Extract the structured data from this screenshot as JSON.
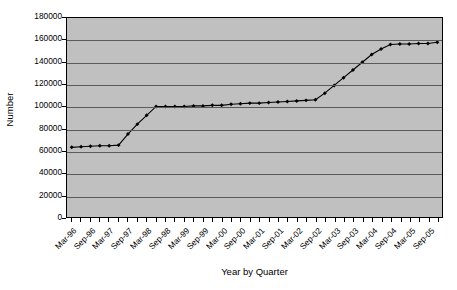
{
  "chart_data": {
    "type": "line",
    "title": "",
    "xlabel": "Year by Quarter",
    "ylabel": "Number",
    "ylim": [
      0,
      180000
    ],
    "ytick_step": 20000,
    "yticks": [
      180000,
      160000,
      140000,
      120000,
      100000,
      80000,
      60000,
      40000,
      20000,
      0
    ],
    "ytick_labels": [
      "180000",
      "160000",
      "140000",
      "120000",
      "100000",
      "80000",
      "60000",
      "40000",
      "20000",
      "0"
    ],
    "grid": true,
    "grid_axis": "y",
    "legend": false,
    "legend_position": "none",
    "marker": "filled-diamond",
    "line_color": "#000000",
    "marker_color": "#000000",
    "plot_background": "#c0c0c0",
    "page_background": "#ffffff",
    "gridline_color": "#5a5a5a",
    "axis_color": "#000000",
    "categories": [
      "Mar-96",
      "Jun-96",
      "Sep-96",
      "Dec-96",
      "Mar-97",
      "Jun-97",
      "Sep-97",
      "Dec-97",
      "Mar-98",
      "Jun-98",
      "Sep-98",
      "Dec-98",
      "Mar-99",
      "Jun-99",
      "Sep-99",
      "Dec-99",
      "Mar-00",
      "Jun-00",
      "Sep-00",
      "Dec-00",
      "Mar-01",
      "Jun-01",
      "Sep-01",
      "Dec-01",
      "Mar-02",
      "Jun-02",
      "Sep-02",
      "Dec-02",
      "Mar-03",
      "Jun-03",
      "Sep-03",
      "Dec-03",
      "Mar-04",
      "Jun-04",
      "Sep-04",
      "Dec-04",
      "Mar-05",
      "Jun-05",
      "Sep-05",
      "Dec-05"
    ],
    "xtick_labels_shown": [
      "Mar-96",
      "Sep-96",
      "Mar-97",
      "Sep-97",
      "Mar-98",
      "Sep-98",
      "Mar-99",
      "Sep-99",
      "Mar-00",
      "Sep-00",
      "Mar-01",
      "Sep-01",
      "Mar-02",
      "Sep-02",
      "Mar-03",
      "Sep-03",
      "Mar-04",
      "Sep-04",
      "Mar-05",
      "Sep-05"
    ],
    "values": [
      63000,
      63500,
      64000,
      64500,
      64500,
      65000,
      75000,
      84000,
      92000,
      100000,
      100000,
      100000,
      100000,
      100500,
      100500,
      101000,
      101000,
      102000,
      102500,
      103000,
      103000,
      103500,
      104000,
      104500,
      105000,
      105500,
      106000,
      112000,
      119000,
      126000,
      133000,
      140000,
      147000,
      152000,
      156000,
      156500,
      156500,
      157000,
      157000,
      158000
    ],
    "series_name": "Number"
  }
}
